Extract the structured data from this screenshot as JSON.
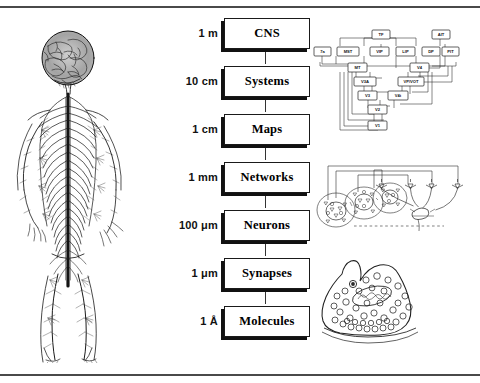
{
  "figure": {
    "frame": {
      "top_rule": true,
      "bottom_rule": true
    }
  },
  "left_panel": {
    "name": "human-nervous-system-engraving",
    "description": "Anatomical engraving of the human central and peripheral nervous system: brain, spinal cord and radiating peripheral nerves"
  },
  "ladder": {
    "levels": [
      {
        "scale": "1 m",
        "label": "CNS"
      },
      {
        "scale": "10 cm",
        "label": "Systems"
      },
      {
        "scale": "1 cm",
        "label": "Maps"
      },
      {
        "scale": "1 mm",
        "label": "Networks"
      },
      {
        "scale": "100 μm",
        "label": "Neurons"
      },
      {
        "scale": "1 μm",
        "label": "Synapses"
      },
      {
        "scale": "1 Å",
        "label": "Molecules"
      }
    ]
  },
  "right_panels": [
    {
      "name": "cortical-hierarchy-diagram",
      "aligned_to": "Systems",
      "description": "Box-and-line connectivity diagram of visual cortical areas",
      "nodes": [
        "TF",
        "AIT",
        "7a",
        "MST",
        "VIP",
        "LIP",
        "DP",
        "PIT",
        "MT",
        "V4",
        "V3A",
        "VP/VOT",
        "V3",
        "V4t",
        "V2",
        "V1"
      ]
    },
    {
      "name": "neural-network-circuit",
      "aligned_to": "Networks",
      "description": "Circuit schematic: clustered cell assemblies on the left with recurrent feedback projections to pyramidal neurons on the right"
    },
    {
      "name": "synaptic-bouton-illustration",
      "aligned_to": "Synapses",
      "description": "Presynaptic terminal containing synaptic vesicles, a mitochondrion and vesicles docked at the active zone"
    }
  ],
  "colors": {
    "ink": "#000000",
    "rule": "#4a4a4a",
    "box_shadow": "#111111",
    "background": "#ffffff"
  }
}
